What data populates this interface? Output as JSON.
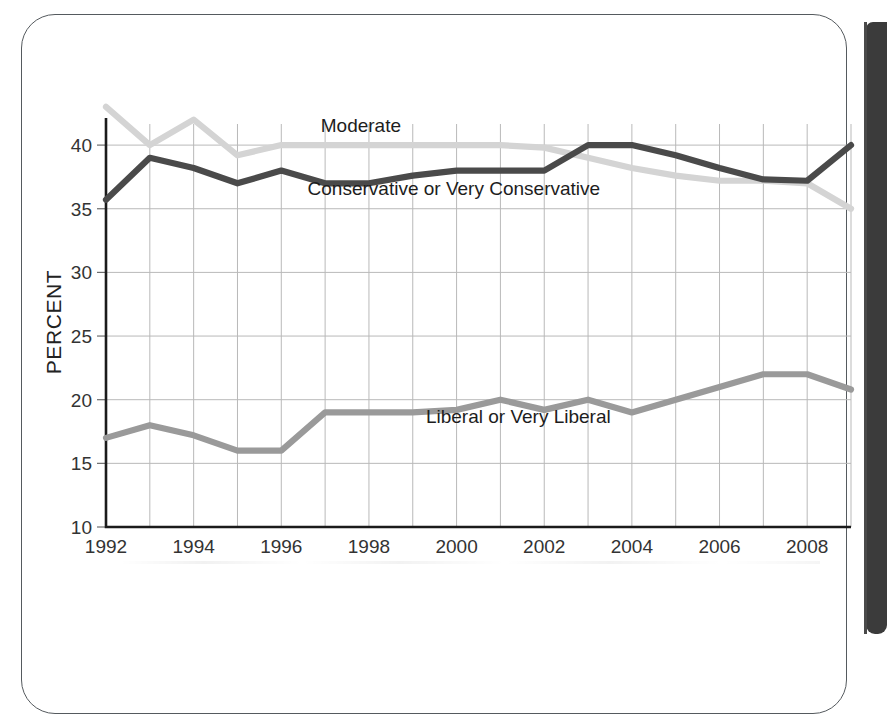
{
  "figure": {
    "axis_title_y": "PERCENT",
    "y_ticks": [
      "10",
      "15",
      "20",
      "25",
      "30",
      "35",
      "40"
    ],
    "x_ticks": [
      "1992",
      "1994",
      "1996",
      "1998",
      "2000",
      "2002",
      "2004",
      "2006",
      "2008"
    ],
    "series_labels": {
      "moderate": "Moderate",
      "conservative": "Conservative or Very Conservative",
      "liberal": "Liberal or Very Liberal"
    }
  },
  "chart_data": {
    "type": "line",
    "title": "",
    "xlabel": "",
    "ylabel": "PERCENT",
    "xlim": [
      1992,
      2009
    ],
    "ylim": [
      10,
      41.5
    ],
    "y_ticks": [
      10,
      15,
      20,
      25,
      30,
      35,
      40
    ],
    "x_ticks": [
      1992,
      1994,
      1996,
      1998,
      2000,
      2002,
      2004,
      2006,
      2008
    ],
    "x_gridlines": [
      1992,
      1993,
      1994,
      1995,
      1996,
      1997,
      1998,
      1999,
      2000,
      2001,
      2002,
      2003,
      2004,
      2005,
      2006,
      2007,
      2008,
      2009
    ],
    "grid": true,
    "legend": "inline-labels",
    "x": [
      1992,
      1993,
      1994,
      1995,
      1996,
      1997,
      1998,
      1999,
      2000,
      2001,
      2002,
      2003,
      2004,
      2005,
      2006,
      2007,
      2008,
      2009
    ],
    "series": [
      {
        "name": "Moderate",
        "color": "#d4d4d4",
        "label_position": {
          "x": 1996.9,
          "y": 41.0
        },
        "values": [
          43.0,
          40.0,
          42.0,
          39.2,
          40.0,
          40.0,
          40.0,
          40.0,
          40.0,
          40.0,
          39.8,
          39.0,
          38.2,
          37.6,
          37.2,
          37.2,
          37.0,
          35.0
        ]
      },
      {
        "name": "Conservative or Very Conservative",
        "color": "#4a4a4a",
        "label_position": {
          "x": 1996.6,
          "y": 36.1
        },
        "values": [
          35.7,
          39.0,
          38.2,
          37.0,
          38.0,
          37.0,
          37.0,
          37.6,
          38.0,
          38.0,
          38.0,
          40.0,
          40.0,
          39.2,
          38.2,
          37.3,
          37.2,
          40.0
        ]
      },
      {
        "name": "Liberal or Very Liberal",
        "color": "#9a9a9a",
        "label_position": {
          "x": 1999.3,
          "y": 18.2
        },
        "values": [
          17.0,
          18.0,
          17.2,
          16.0,
          16.0,
          19.0,
          19.0,
          19.0,
          19.2,
          20.0,
          19.2,
          20.0,
          19.0,
          20.0,
          21.0,
          22.0,
          22.0,
          20.8
        ]
      }
    ]
  }
}
